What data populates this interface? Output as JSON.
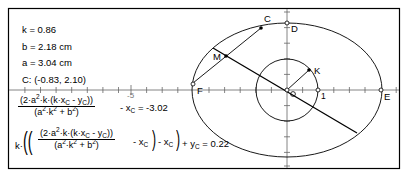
{
  "measurements": {
    "k": "k = 0.86",
    "b": "b = 2.18 cm",
    "a": "a = 3.04 cm",
    "C": "C: (-0.83, 2.10)"
  },
  "calculations": {
    "xcalc": {
      "numerator": "(2·a²·k·(k·x_C - y_C))",
      "denominator": "(a²·k² + b²)",
      "suffix": "- x_C = -3.02",
      "result": "-3.02"
    },
    "ycalc": {
      "prefix": "k·",
      "numerator": "(2·a²·k·(k·x_C - y_C))",
      "denominator": "(a²·k² + b²)",
      "suffix": "- x_C) - x_C) + y_C = 0.22",
      "result": "0.22"
    }
  },
  "axis": {
    "tick_label_neg5": "-5",
    "tick_label_1": "1"
  },
  "points": {
    "C": "C",
    "D": "D",
    "M": "M",
    "K": "K",
    "F": "F",
    "E": "E"
  },
  "geometry": {
    "origin_px": [
      287,
      90
    ],
    "unit_px": 31.2,
    "ellipse_rx_px": 95,
    "ellipse_ry_px": 67,
    "circle_r_px": 31
  },
  "colors": {
    "stroke": "#000000",
    "axis": "#555555",
    "background": "#ffffff"
  }
}
